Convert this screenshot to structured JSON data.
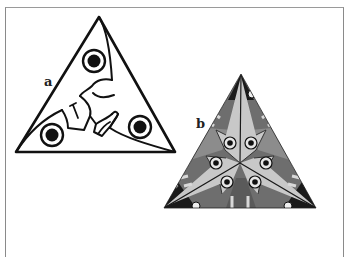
{
  "figure": {
    "panels": [
      {
        "id": "a",
        "label": "a",
        "description": "Line drawing of triangle with three eye motifs and curved interlocking shapes"
      },
      {
        "id": "b",
        "label": "b",
        "description": "Shaded triangle tessellation with three-fold symmetric fish-like motifs and six eyes"
      }
    ],
    "colors": {
      "ink": "#111111",
      "light_gray": "#c8c8c8",
      "mid_gray": "#8c8c8c",
      "dark_gray": "#5a5a5a",
      "frame": "#8a8a8a"
    }
  }
}
